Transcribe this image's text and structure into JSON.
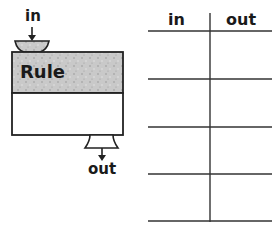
{
  "machine": {
    "input_label": "in",
    "rule_label": "Rule",
    "output_label": "out",
    "colors": {
      "rule_fill": "#c8c8c8",
      "outline": "#222222",
      "body_fill": "#ffffff"
    }
  },
  "table": {
    "columns": [
      "in",
      "out"
    ],
    "rows": [
      [
        "",
        ""
      ],
      [
        "",
        ""
      ],
      [
        "",
        ""
      ],
      [
        "",
        ""
      ]
    ]
  }
}
